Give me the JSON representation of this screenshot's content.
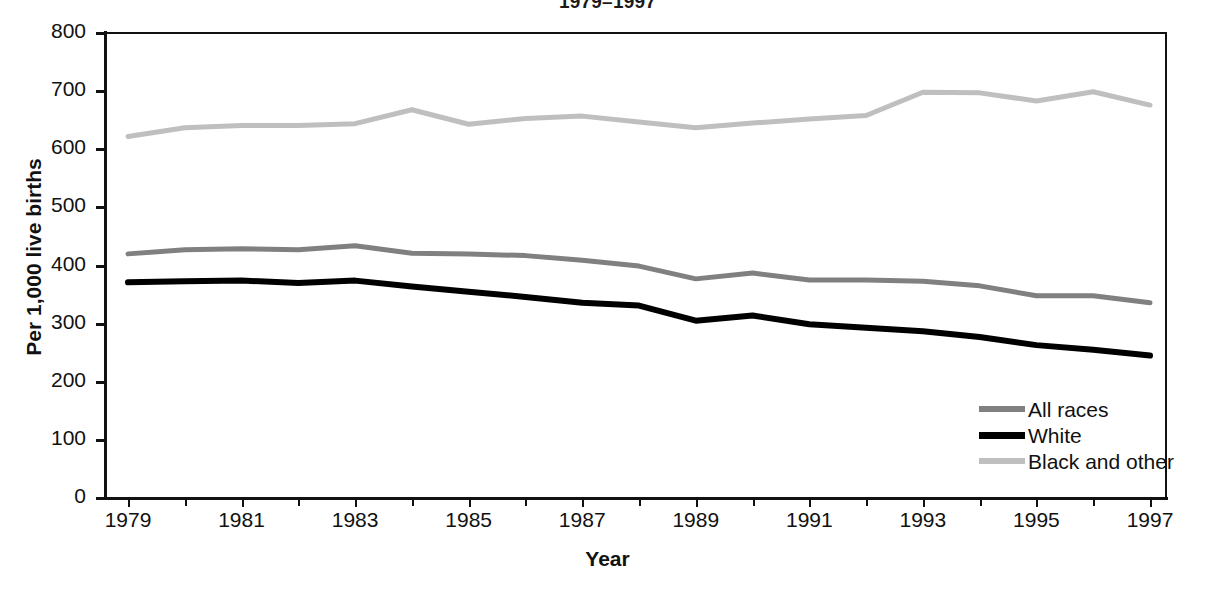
{
  "chart_data": {
    "type": "line",
    "title": "1979–1997",
    "xlabel": "Year",
    "ylabel": "Per 1,000 live births",
    "xlim": [
      1979,
      1997
    ],
    "ylim": [
      0,
      800
    ],
    "ytick_values": [
      0,
      100,
      200,
      300,
      400,
      500,
      600,
      700,
      800
    ],
    "ytick_labels": [
      "0",
      "100",
      "200",
      "300",
      "400",
      "500",
      "600",
      "700",
      "800"
    ],
    "xtick_values": [
      1979,
      1981,
      1983,
      1985,
      1987,
      1989,
      1991,
      1993,
      1995,
      1997
    ],
    "xtick_labels": [
      "1979",
      "1981",
      "1983",
      "1985",
      "1987",
      "1989",
      "1991",
      "1993",
      "1995",
      "1997"
    ],
    "minor_xticks": [
      1980,
      1982,
      1984,
      1986,
      1988,
      1990,
      1992,
      1994,
      1996
    ],
    "grid": false,
    "legend_position": "lower right",
    "x": [
      1979,
      1980,
      1981,
      1982,
      1983,
      1984,
      1985,
      1986,
      1987,
      1988,
      1989,
      1990,
      1991,
      1992,
      1993,
      1994,
      1995,
      1996,
      1997
    ],
    "series": [
      {
        "name": "All races",
        "color": "#808080",
        "values": [
          420,
          427,
          429,
          427,
          434,
          421,
          420,
          417,
          409,
          399,
          377,
          387,
          375,
          375,
          373,
          365,
          348,
          348,
          336
        ]
      },
      {
        "name": "White",
        "color": "#000000",
        "values": [
          371,
          373,
          374,
          370,
          374,
          364,
          355,
          346,
          336,
          331,
          305,
          314,
          299,
          293,
          287,
          277,
          263,
          255,
          245
        ]
      },
      {
        "name": "Black and other",
        "color": "#bfbfbf",
        "values": [
          622,
          637,
          641,
          641,
          644,
          668,
          643,
          653,
          657,
          647,
          637,
          645,
          652,
          658,
          698,
          697,
          683,
          699,
          676
        ]
      }
    ]
  },
  "legend": {
    "entries": [
      {
        "label": "All races",
        "color": "#808080"
      },
      {
        "label": "White",
        "color": "#000000"
      },
      {
        "label": "Black and other",
        "color": "#bfbfbf"
      }
    ]
  }
}
